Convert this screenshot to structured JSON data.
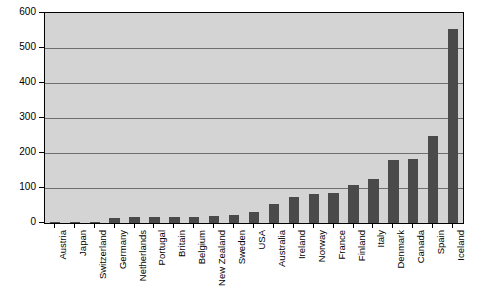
{
  "chart_data": {
    "type": "bar",
    "title": "",
    "subtitle": "",
    "xlabel": "",
    "ylabel": "",
    "ylim": [
      0,
      600
    ],
    "ytick_values": [
      0,
      100,
      200,
      300,
      400,
      500,
      600
    ],
    "ytick_labels": [
      "0",
      "100",
      "200",
      "300",
      "400",
      "500",
      "600"
    ],
    "grid": true,
    "legend": false,
    "legend_position": "none",
    "orientation": "vertical",
    "bar_color": "#4a4a4a",
    "plot_background": "#d4d4d4",
    "categories": [
      "Austria",
      "Japan",
      "Switzerland",
      "Germany",
      "Netherlands",
      "Portugal",
      "Britain",
      "Belgium",
      "New Zealand",
      "Sweden",
      "USA",
      "Australia",
      "Ireland",
      "Norway",
      "France",
      "Finland",
      "Italy",
      "Denmark",
      "Canada",
      "Spain",
      "Iceland"
    ],
    "values": [
      2,
      3,
      4,
      14,
      16,
      16,
      17,
      18,
      19,
      22,
      31,
      55,
      75,
      82,
      85,
      108,
      127,
      180,
      183,
      250,
      555
    ]
  }
}
